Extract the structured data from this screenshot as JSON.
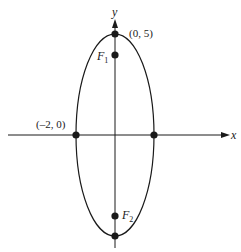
{
  "figure": {
    "type": "ellipse-diagram",
    "axes": {
      "x_label": "x",
      "y_label": "y"
    },
    "ellipse": {
      "center": [
        0,
        0
      ],
      "semi_major_vertical": 5,
      "semi_minor_horizontal": 2
    },
    "points": [
      {
        "id": "top-vertex",
        "label": "(0, 5)",
        "coords": [
          0,
          5
        ]
      },
      {
        "id": "left-vertex",
        "label": "(–2, 0)",
        "coords": [
          -2,
          0
        ]
      },
      {
        "id": "right-vertex",
        "label": "",
        "coords": [
          2,
          0
        ]
      },
      {
        "id": "bottom-vertex",
        "label": "",
        "coords": [
          0,
          -5
        ]
      },
      {
        "id": "focus-1",
        "label": "F",
        "subscript": "1"
      },
      {
        "id": "focus-2",
        "label": "F",
        "subscript": "2"
      }
    ],
    "labels": {
      "top_vertex": "(0, 5)",
      "left_vertex": "(–2, 0)",
      "focus1_main": "F",
      "focus1_sub": "1",
      "focus2_main": "F",
      "focus2_sub": "2"
    },
    "colors": {
      "stroke": "#1a1a1a",
      "background": "#ffffff"
    }
  }
}
